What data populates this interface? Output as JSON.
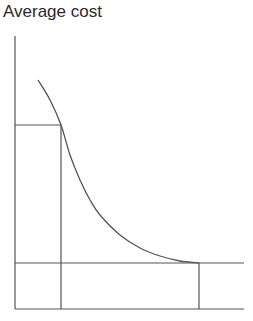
{
  "diagram": {
    "title": "Average cost",
    "type": "average-cost-curve",
    "elements": {
      "y_axis": {
        "x": 15,
        "y_top": 36,
        "y_bottom": 309
      },
      "x_axis": {
        "y": 309,
        "x_left": 15,
        "x_right": 244
      },
      "curve_points": [
        [
          38,
          80
        ],
        [
          50,
          100
        ],
        [
          61,
          125
        ],
        [
          70,
          155
        ],
        [
          80,
          180
        ],
        [
          90,
          200
        ],
        [
          100,
          215
        ],
        [
          120,
          235
        ],
        [
          140,
          248
        ],
        [
          160,
          256
        ],
        [
          180,
          261
        ],
        [
          199,
          263
        ]
      ],
      "high_cost_guide": {
        "y": 125,
        "x_left": 15,
        "x_right": 61,
        "vertical_x": 61
      },
      "low_cost_guide": {
        "y": 263,
        "x_left": 15,
        "x_right": 244,
        "vertical_x": 199
      }
    },
    "colors": {
      "line": "#555555",
      "text": "#2a2a2a",
      "background": "#ffffff"
    }
  }
}
